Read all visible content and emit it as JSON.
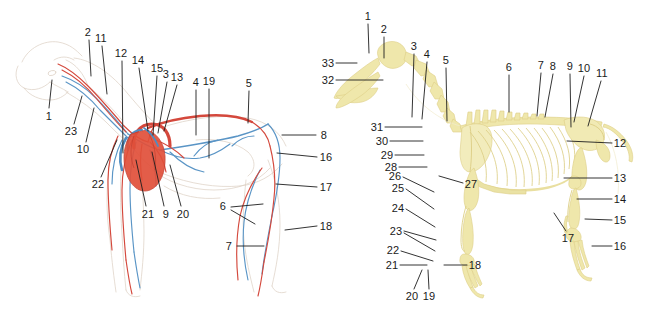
{
  "figure": {
    "background_color": "#ffffff",
    "label_color": "#1a1a1a",
    "leader_color": "#1d1d1d"
  },
  "panels": [
    {
      "id": "vascular",
      "name": "circulatory-system-diagram",
      "subject": "dog",
      "view": "left lateral",
      "colors": {
        "artery": "#d9443a",
        "vein": "#4f90c4",
        "heart": "#e1503a",
        "outline": "#d9c8b8"
      },
      "labels": [
        {
          "id": "v-1",
          "text": "1",
          "x": 49,
          "y": 116,
          "line": {
            "x1": 49,
            "y1": 108,
            "x2": 52,
            "y2": 80
          }
        },
        {
          "id": "v-2",
          "text": "2",
          "x": 88,
          "y": 32,
          "line": {
            "x1": 89,
            "y1": 40,
            "x2": 91,
            "y2": 76
          }
        },
        {
          "id": "v-3",
          "text": "3",
          "x": 166,
          "y": 74,
          "line": {
            "x1": 167,
            "y1": 82,
            "x2": 158,
            "y2": 133
          }
        },
        {
          "id": "v-4",
          "text": "4",
          "x": 196,
          "y": 82,
          "line": {
            "x1": 196,
            "y1": 90,
            "x2": 196,
            "y2": 135
          }
        },
        {
          "id": "v-5",
          "text": "5",
          "x": 249,
          "y": 83,
          "line": {
            "x1": 249,
            "y1": 91,
            "x2": 248,
            "y2": 123
          }
        },
        {
          "id": "v-6",
          "text": "6",
          "x": 223,
          "y": 206,
          "line": {
            "x1": 231,
            "y1": 207,
            "x2": 263,
            "y2": 204
          },
          "line2": {
            "x1": 231,
            "y1": 210,
            "x2": 255,
            "y2": 224
          }
        },
        {
          "id": "v-7",
          "text": "7",
          "x": 229,
          "y": 246,
          "line": {
            "x1": 237,
            "y1": 246,
            "x2": 264,
            "y2": 246
          }
        },
        {
          "id": "v-8",
          "text": "8",
          "x": 324,
          "y": 135,
          "line": {
            "x1": 316,
            "y1": 135,
            "x2": 282,
            "y2": 135
          }
        },
        {
          "id": "v-9",
          "text": "9",
          "x": 166,
          "y": 214,
          "line": {
            "x1": 164,
            "y1": 206,
            "x2": 152,
            "y2": 152
          }
        },
        {
          "id": "v-10",
          "text": "10",
          "x": 83,
          "y": 149,
          "line": {
            "x1": 86,
            "y1": 142,
            "x2": 94,
            "y2": 108
          }
        },
        {
          "id": "v-11",
          "text": "11",
          "x": 101,
          "y": 38,
          "line": {
            "x1": 102,
            "y1": 46,
            "x2": 107,
            "y2": 94
          }
        },
        {
          "id": "v-12",
          "text": "12",
          "x": 121,
          "y": 53,
          "line": {
            "x1": 122,
            "y1": 61,
            "x2": 123,
            "y2": 153
          }
        },
        {
          "id": "v-13",
          "text": "13",
          "x": 177,
          "y": 77,
          "line": {
            "x1": 177,
            "y1": 85,
            "x2": 164,
            "y2": 131
          }
        },
        {
          "id": "v-14",
          "text": "14",
          "x": 138,
          "y": 60,
          "line": {
            "x1": 139,
            "y1": 68,
            "x2": 148,
            "y2": 131
          }
        },
        {
          "id": "v-15",
          "text": "15",
          "x": 157,
          "y": 68,
          "line": {
            "x1": 157,
            "y1": 76,
            "x2": 153,
            "y2": 135
          }
        },
        {
          "id": "v-16",
          "text": "16",
          "x": 326,
          "y": 157,
          "line": {
            "x1": 317,
            "y1": 157,
            "x2": 277,
            "y2": 153
          }
        },
        {
          "id": "v-17",
          "text": "17",
          "x": 326,
          "y": 187,
          "line": {
            "x1": 317,
            "y1": 187,
            "x2": 276,
            "y2": 184
          }
        },
        {
          "id": "v-18",
          "text": "18",
          "x": 326,
          "y": 226,
          "line": {
            "x1": 317,
            "y1": 226,
            "x2": 285,
            "y2": 230
          }
        },
        {
          "id": "v-19",
          "text": "19",
          "x": 209,
          "y": 81,
          "line": {
            "x1": 209,
            "y1": 89,
            "x2": 209,
            "y2": 158
          }
        },
        {
          "id": "v-20",
          "text": "20",
          "x": 183,
          "y": 214,
          "line": {
            "x1": 181,
            "y1": 206,
            "x2": 170,
            "y2": 165
          }
        },
        {
          "id": "v-21",
          "text": "21",
          "x": 148,
          "y": 214,
          "line": {
            "x1": 146,
            "y1": 206,
            "x2": 136,
            "y2": 160
          }
        },
        {
          "id": "v-22",
          "text": "22",
          "x": 98,
          "y": 184,
          "line": {
            "x1": 101,
            "y1": 177,
            "x2": 117,
            "y2": 140
          }
        },
        {
          "id": "v-23",
          "text": "23",
          "x": 71,
          "y": 131,
          "line": {
            "x1": 74,
            "y1": 124,
            "x2": 82,
            "y2": 96
          }
        }
      ]
    },
    {
      "id": "skeletal",
      "name": "skeleton-diagram",
      "subject": "dog",
      "view": "left lateral",
      "colors": {
        "bone": "#efe7ab",
        "bone_outline": "#ded08a"
      },
      "labels": [
        {
          "id": "s-1",
          "text": "1",
          "x": 368,
          "y": 16,
          "line": {
            "x1": 368,
            "y1": 24,
            "x2": 369,
            "y2": 53
          }
        },
        {
          "id": "s-2",
          "text": "2",
          "x": 384,
          "y": 29,
          "line": {
            "x1": 384,
            "y1": 37,
            "x2": 384,
            "y2": 58
          }
        },
        {
          "id": "s-3",
          "text": "3",
          "x": 414,
          "y": 46,
          "line": {
            "x1": 414,
            "y1": 54,
            "x2": 412,
            "y2": 117
          }
        },
        {
          "id": "s-4",
          "text": "4",
          "x": 427,
          "y": 54,
          "line": {
            "x1": 427,
            "y1": 62,
            "x2": 422,
            "y2": 119
          }
        },
        {
          "id": "s-5",
          "text": "5",
          "x": 446,
          "y": 60,
          "line": {
            "x1": 446,
            "y1": 68,
            "x2": 447,
            "y2": 121
          }
        },
        {
          "id": "s-6",
          "text": "6",
          "x": 509,
          "y": 67,
          "line": {
            "x1": 509,
            "y1": 75,
            "x2": 509,
            "y2": 112
          }
        },
        {
          "id": "s-7",
          "text": "7",
          "x": 541,
          "y": 65,
          "line": {
            "x1": 541,
            "y1": 73,
            "x2": 537,
            "y2": 116
          }
        },
        {
          "id": "s-8",
          "text": "8",
          "x": 553,
          "y": 66,
          "line": {
            "x1": 553,
            "y1": 74,
            "x2": 545,
            "y2": 117
          }
        },
        {
          "id": "s-9",
          "text": "9",
          "x": 570,
          "y": 66,
          "line": {
            "x1": 570,
            "y1": 74,
            "x2": 571,
            "y2": 127
          }
        },
        {
          "id": "s-10",
          "text": "10",
          "x": 584,
          "y": 68,
          "line": {
            "x1": 584,
            "y1": 76,
            "x2": 574,
            "y2": 122
          }
        },
        {
          "id": "s-11",
          "text": "11",
          "x": 602,
          "y": 73,
          "line": {
            "x1": 601,
            "y1": 81,
            "x2": 588,
            "y2": 126
          }
        },
        {
          "id": "s-12",
          "text": "12",
          "x": 620,
          "y": 143,
          "line": {
            "x1": 612,
            "y1": 143,
            "x2": 567,
            "y2": 141
          }
        },
        {
          "id": "s-13",
          "text": "13",
          "x": 620,
          "y": 178,
          "line": {
            "x1": 612,
            "y1": 178,
            "x2": 564,
            "y2": 178
          }
        },
        {
          "id": "s-14",
          "text": "14",
          "x": 620,
          "y": 199,
          "line": {
            "x1": 612,
            "y1": 199,
            "x2": 577,
            "y2": 199
          }
        },
        {
          "id": "s-15",
          "text": "15",
          "x": 620,
          "y": 220,
          "line": {
            "x1": 612,
            "y1": 220,
            "x2": 585,
            "y2": 219
          }
        },
        {
          "id": "s-16",
          "text": "16",
          "x": 620,
          "y": 246,
          "line": {
            "x1": 612,
            "y1": 246,
            "x2": 592,
            "y2": 246
          }
        },
        {
          "id": "s-17",
          "text": "17",
          "x": 568,
          "y": 238,
          "line": {
            "x1": 566,
            "y1": 231,
            "x2": 554,
            "y2": 213
          }
        },
        {
          "id": "s-18",
          "text": "18",
          "x": 475,
          "y": 265,
          "line": {
            "x1": 467,
            "y1": 265,
            "x2": 444,
            "y2": 265
          }
        },
        {
          "id": "s-19",
          "text": "19",
          "x": 429,
          "y": 296,
          "line": {
            "x1": 429,
            "y1": 289,
            "x2": 428,
            "y2": 270
          }
        },
        {
          "id": "s-20",
          "text": "20",
          "x": 412,
          "y": 296,
          "line": {
            "x1": 414,
            "y1": 289,
            "x2": 422,
            "y2": 270
          }
        },
        {
          "id": "s-21",
          "text": "21",
          "x": 392,
          "y": 265,
          "line": {
            "x1": 400,
            "y1": 265,
            "x2": 427,
            "y2": 265
          }
        },
        {
          "id": "s-22",
          "text": "22",
          "x": 393,
          "y": 250,
          "line": {
            "x1": 401,
            "y1": 251,
            "x2": 433,
            "y2": 261
          }
        },
        {
          "id": "s-23",
          "text": "23",
          "x": 396,
          "y": 231,
          "line": {
            "x1": 404,
            "y1": 231,
            "x2": 436,
            "y2": 240
          },
          "line2": {
            "x1": 404,
            "y1": 233,
            "x2": 435,
            "y2": 251
          }
        },
        {
          "id": "s-24",
          "text": "24",
          "x": 398,
          "y": 208,
          "line": {
            "x1": 406,
            "y1": 209,
            "x2": 435,
            "y2": 227
          }
        },
        {
          "id": "s-25",
          "text": "25",
          "x": 398,
          "y": 188,
          "line": {
            "x1": 406,
            "y1": 189,
            "x2": 434,
            "y2": 209
          }
        },
        {
          "id": "s-26",
          "text": "26",
          "x": 395,
          "y": 176,
          "line": {
            "x1": 403,
            "y1": 177,
            "x2": 434,
            "y2": 192
          }
        },
        {
          "id": "s-27",
          "text": "27",
          "x": 471,
          "y": 184,
          "line": {
            "x1": 463,
            "y1": 183,
            "x2": 439,
            "y2": 176
          }
        },
        {
          "id": "s-28",
          "text": "28",
          "x": 391,
          "y": 167,
          "line": {
            "x1": 399,
            "y1": 167,
            "x2": 427,
            "y2": 167
          }
        },
        {
          "id": "s-29",
          "text": "29",
          "x": 387,
          "y": 155,
          "line": {
            "x1": 395,
            "y1": 155,
            "x2": 424,
            "y2": 155
          }
        },
        {
          "id": "s-30",
          "text": "30",
          "x": 382,
          "y": 141,
          "line": {
            "x1": 390,
            "y1": 141,
            "x2": 423,
            "y2": 141
          }
        },
        {
          "id": "s-31",
          "text": "31",
          "x": 377,
          "y": 127,
          "line": {
            "x1": 385,
            "y1": 127,
            "x2": 422,
            "y2": 127
          }
        },
        {
          "id": "s-32",
          "text": "32",
          "x": 328,
          "y": 80,
          "line": {
            "x1": 336,
            "y1": 80,
            "x2": 383,
            "y2": 80
          }
        },
        {
          "id": "s-33",
          "text": "33",
          "x": 328,
          "y": 63,
          "line": {
            "x1": 336,
            "y1": 63,
            "x2": 357,
            "y2": 63
          }
        }
      ]
    }
  ]
}
